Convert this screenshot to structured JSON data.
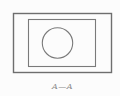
{
  "drawing": {
    "type": "technical-section-view",
    "section_label": "A—A",
    "outer_line_color": "#6e6e6e",
    "inner_line_color": "#7a7a7a",
    "label_color": "#8a8a8a",
    "background_color": "#fcfcfc"
  }
}
